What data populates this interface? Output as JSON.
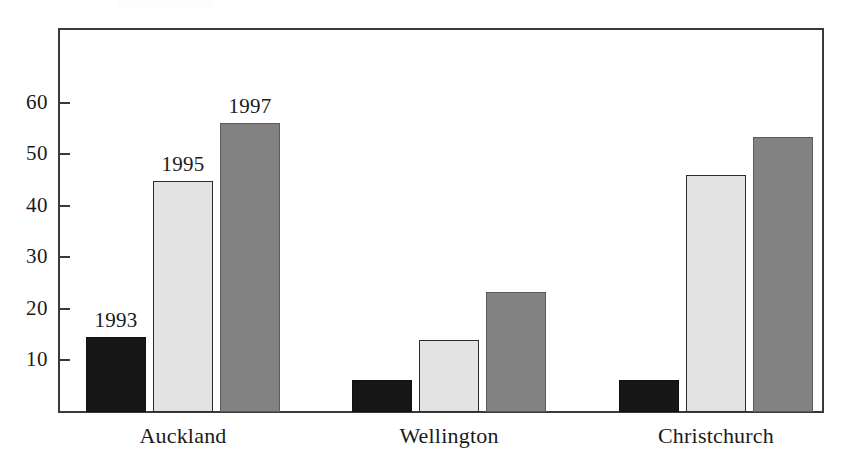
{
  "chart_data": {
    "type": "bar",
    "title": "",
    "subtitle": "",
    "xlabel": "",
    "ylabel": "",
    "categories": [
      "Auckland",
      "Wellington",
      "Christchurch"
    ],
    "series": [
      {
        "name": "1993",
        "values": [
          14.5,
          6.2,
          6.2
        ],
        "color": "#171717"
      },
      {
        "name": "1995",
        "values": [
          44.8,
          14.0,
          46.0
        ],
        "color": "#e3e3e3"
      },
      {
        "name": "1997",
        "values": [
          56.0,
          23.2,
          53.3
        ],
        "color": "#828282"
      }
    ],
    "ylim": [
      0,
      74
    ],
    "yticks": [
      10,
      20,
      30,
      40,
      50,
      60
    ],
    "ytick_labels": [
      "10",
      "20",
      "30",
      "40",
      "50",
      "60"
    ],
    "grid": false,
    "legend": "none",
    "bar_labels": {
      "note": "series names printed above the first group's bars",
      "group_index": 0,
      "labels": [
        "1993",
        "1995",
        "1997"
      ]
    },
    "frame": {
      "border_color": "#3a3a3a",
      "background": "#ffffff"
    }
  }
}
